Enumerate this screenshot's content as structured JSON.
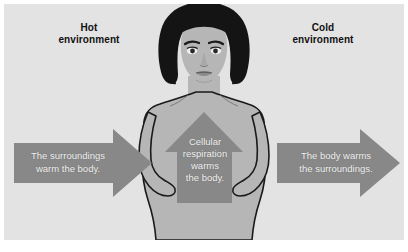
{
  "figure": {
    "type": "biology-diagram",
    "background_color": "#e3e3e3",
    "frame_color": "#ffffff",
    "arrow_color": "#888888",
    "skin_color": "#b6b6b6",
    "hair_color": "#141414",
    "outline_color": "#1a1a1a",
    "label_color": "#111111",
    "arrow_text_color": "#f2f2f2"
  },
  "labels": {
    "hot_environment": "Hot\nenvironment",
    "cold_environment": "Cold\nenvironment"
  },
  "arrows": [
    {
      "id": "left-arrow",
      "direction": "right",
      "text": "The surroundings\nwarm the body.",
      "meaning": "heat flows from hot environment into the body"
    },
    {
      "id": "center-arrow",
      "direction": "up",
      "text": "Cellular\nrespiration\nwarms\nthe body.",
      "meaning": "metabolic heat generated inside the body"
    },
    {
      "id": "right-arrow",
      "direction": "right",
      "text": "The body warms\nthe surroundings.",
      "meaning": "heat flows from the body into the cold environment"
    }
  ],
  "figure_subject": {
    "name": "human-figure",
    "description": "front-facing woman with shoulder-length dark hair, arms at sides, hands on hips"
  }
}
